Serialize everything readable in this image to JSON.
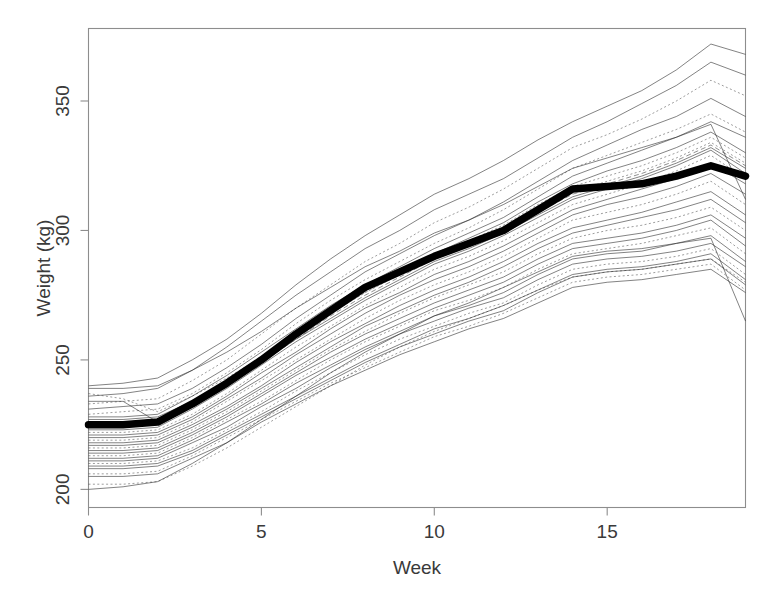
{
  "chart_data": {
    "type": "line",
    "title": "",
    "subtitle": "",
    "xlabel": "Week",
    "ylabel": "Weight (kg)",
    "xlim": [
      0,
      19
    ],
    "ylim": [
      193,
      378
    ],
    "xticks": [
      0,
      5,
      10,
      15
    ],
    "xtick_labels": [
      "0",
      "5",
      "10",
      "15"
    ],
    "yticks": [
      200,
      250,
      300,
      350
    ],
    "ytick_labels": [
      "200",
      "250",
      "300",
      "350"
    ],
    "grid": false,
    "legend": "none",
    "x": [
      0,
      1,
      2,
      3,
      4,
      5,
      6,
      7,
      8,
      9,
      10,
      11,
      12,
      13,
      14,
      15,
      16,
      17,
      18,
      19
    ],
    "mean_series": {
      "name": "Mean weight",
      "style": "solid-heavy",
      "color": "#000000",
      "values": [
        225,
        225,
        226,
        233,
        241,
        250,
        260,
        269,
        278,
        284,
        290,
        295,
        300,
        308,
        316,
        317,
        318,
        321,
        325,
        321
      ]
    },
    "series": [
      {
        "name": "subject-01",
        "style": "solid",
        "values": [
          240,
          241,
          243,
          250,
          258,
          268,
          279,
          289,
          298,
          306,
          314,
          320,
          327,
          335,
          342,
          348,
          354,
          362,
          372,
          368
        ]
      },
      {
        "name": "subject-02",
        "style": "solid",
        "values": [
          236,
          237,
          239,
          246,
          255,
          265,
          275,
          284,
          293,
          300,
          308,
          314,
          320,
          328,
          336,
          342,
          349,
          356,
          365,
          360
        ]
      },
      {
        "name": "subject-03",
        "style": "dotted",
        "values": [
          233,
          234,
          235,
          242,
          250,
          260,
          270,
          279,
          288,
          295,
          303,
          309,
          316,
          324,
          332,
          337,
          343,
          350,
          358,
          352
        ]
      },
      {
        "name": "subject-04",
        "style": "solid",
        "values": [
          231,
          232,
          233,
          239,
          247,
          256,
          266,
          275,
          284,
          291,
          298,
          304,
          311,
          319,
          327,
          333,
          339,
          344,
          351,
          344
        ]
      },
      {
        "name": "subject-05",
        "style": "dotted",
        "values": [
          229,
          230,
          231,
          237,
          245,
          254,
          264,
          273,
          281,
          288,
          295,
          301,
          308,
          316,
          324,
          329,
          334,
          339,
          345,
          338
        ]
      },
      {
        "name": "subject-06",
        "style": "solid",
        "values": [
          228,
          228,
          229,
          236,
          244,
          253,
          262,
          271,
          279,
          286,
          293,
          299,
          305,
          313,
          321,
          326,
          331,
          336,
          342,
          336
        ]
      },
      {
        "name": "subject-07",
        "style": "solid",
        "values": [
          227,
          227,
          228,
          234,
          242,
          251,
          260,
          269,
          277,
          284,
          291,
          297,
          303,
          311,
          318,
          323,
          327,
          332,
          338,
          330
        ]
      },
      {
        "name": "subject-08",
        "style": "dotted",
        "values": [
          226,
          226,
          227,
          233,
          241,
          250,
          259,
          268,
          276,
          283,
          290,
          296,
          302,
          310,
          317,
          321,
          325,
          330,
          336,
          328
        ]
      },
      {
        "name": "subject-09",
        "style": "solid",
        "values": [
          239,
          239,
          240,
          246,
          253,
          261,
          270,
          278,
          286,
          292,
          299,
          304,
          310,
          317,
          324,
          328,
          332,
          336,
          341,
          312
        ]
      },
      {
        "name": "subject-10",
        "style": "dashed",
        "values": [
          224,
          225,
          226,
          232,
          240,
          249,
          258,
          267,
          275,
          282,
          289,
          294,
          300,
          307,
          314,
          318,
          322,
          327,
          333,
          325
        ]
      },
      {
        "name": "subject-11",
        "style": "solid",
        "values": [
          223,
          223,
          224,
          231,
          239,
          248,
          257,
          265,
          273,
          280,
          287,
          292,
          298,
          305,
          312,
          316,
          320,
          325,
          331,
          322
        ]
      },
      {
        "name": "subject-12",
        "style": "dotted",
        "values": [
          222,
          222,
          223,
          229,
          237,
          246,
          255,
          263,
          271,
          278,
          285,
          290,
          296,
          303,
          310,
          314,
          318,
          323,
          329,
          320
        ]
      },
      {
        "name": "subject-13",
        "style": "solid",
        "values": [
          221,
          221,
          222,
          228,
          236,
          245,
          253,
          262,
          270,
          276,
          283,
          288,
          294,
          301,
          308,
          312,
          316,
          320,
          326,
          318
        ]
      },
      {
        "name": "subject-14",
        "style": "solid",
        "values": [
          220,
          220,
          221,
          227,
          235,
          243,
          252,
          260,
          268,
          275,
          281,
          286,
          292,
          299,
          306,
          310,
          313,
          317,
          322,
          314
        ]
      },
      {
        "name": "subject-15",
        "style": "dotted",
        "values": [
          219,
          219,
          220,
          226,
          234,
          242,
          250,
          258,
          266,
          273,
          279,
          284,
          290,
          297,
          304,
          307,
          310,
          314,
          319,
          310
        ]
      },
      {
        "name": "subject-16",
        "style": "solid",
        "values": [
          218,
          218,
          219,
          225,
          232,
          240,
          249,
          257,
          264,
          271,
          277,
          282,
          288,
          295,
          301,
          304,
          307,
          311,
          315,
          306
        ]
      },
      {
        "name": "subject-17",
        "style": "solid",
        "values": [
          217,
          217,
          218,
          224,
          231,
          239,
          247,
          255,
          263,
          269,
          275,
          280,
          286,
          293,
          299,
          302,
          305,
          308,
          312,
          303
        ]
      },
      {
        "name": "subject-18",
        "style": "dotted",
        "values": [
          216,
          216,
          217,
          223,
          230,
          238,
          246,
          254,
          261,
          268,
          274,
          279,
          284,
          291,
          297,
          300,
          302,
          305,
          309,
          300
        ]
      },
      {
        "name": "subject-19",
        "style": "solid",
        "values": [
          215,
          215,
          216,
          222,
          229,
          237,
          245,
          253,
          260,
          266,
          272,
          277,
          282,
          289,
          295,
          297,
          299,
          302,
          306,
          297
        ]
      },
      {
        "name": "subject-20",
        "style": "solid",
        "values": [
          214,
          214,
          215,
          221,
          228,
          236,
          244,
          251,
          258,
          264,
          270,
          275,
          280,
          287,
          293,
          295,
          297,
          300,
          304,
          294
        ]
      },
      {
        "name": "subject-21",
        "style": "dotted",
        "values": [
          213,
          213,
          214,
          220,
          227,
          234,
          242,
          250,
          257,
          263,
          269,
          273,
          278,
          285,
          291,
          293,
          295,
          298,
          301,
          291
        ]
      },
      {
        "name": "subject-22",
        "style": "solid",
        "values": [
          212,
          212,
          213,
          219,
          226,
          233,
          241,
          248,
          255,
          261,
          267,
          271,
          276,
          283,
          289,
          291,
          292,
          295,
          298,
          288
        ]
      },
      {
        "name": "subject-23",
        "style": "solid",
        "values": [
          211,
          211,
          212,
          218,
          224,
          232,
          239,
          247,
          254,
          260,
          265,
          270,
          274,
          281,
          287,
          289,
          290,
          292,
          295,
          286
        ]
      },
      {
        "name": "subject-24",
        "style": "dotted",
        "values": [
          210,
          210,
          211,
          216,
          223,
          230,
          238,
          245,
          252,
          258,
          263,
          268,
          272,
          279,
          285,
          287,
          288,
          290,
          293,
          283
        ]
      },
      {
        "name": "subject-25",
        "style": "solid",
        "values": [
          209,
          209,
          210,
          215,
          222,
          229,
          236,
          243,
          250,
          256,
          262,
          266,
          271,
          277,
          283,
          285,
          286,
          288,
          291,
          281
        ]
      },
      {
        "name": "subject-26",
        "style": "solid",
        "values": [
          208,
          208,
          209,
          214,
          221,
          228,
          235,
          242,
          249,
          255,
          260,
          265,
          269,
          276,
          282,
          284,
          285,
          287,
          289,
          279
        ]
      },
      {
        "name": "subject-27",
        "style": "dotted",
        "values": [
          206,
          206,
          207,
          213,
          220,
          227,
          234,
          241,
          247,
          253,
          259,
          263,
          268,
          274,
          280,
          282,
          283,
          285,
          287,
          277
        ]
      },
      {
        "name": "subject-28",
        "style": "solid",
        "values": [
          205,
          205,
          206,
          212,
          218,
          226,
          233,
          240,
          246,
          252,
          257,
          262,
          266,
          272,
          278,
          280,
          281,
          283,
          285,
          276
        ]
      },
      {
        "name": "subject-29",
        "style": "dotted",
        "values": [
          202,
          202,
          203,
          209,
          216,
          224,
          232,
          240,
          248,
          255,
          261,
          266,
          271,
          277,
          282,
          284,
          285,
          287,
          289,
          280
        ]
      },
      {
        "name": "subject-30",
        "style": "solid",
        "values": [
          200,
          201,
          203,
          210,
          218,
          227,
          236,
          245,
          253,
          260,
          267,
          272,
          278,
          284,
          290,
          292,
          293,
          295,
          297,
          265
        ]
      },
      {
        "name": "subject-31",
        "style": "solid",
        "values": [
          234,
          234,
          226,
          232,
          240,
          249,
          258,
          266,
          274,
          281,
          288,
          293,
          299,
          306,
          313,
          317,
          321,
          326,
          332,
          324
        ]
      },
      {
        "name": "subject-32",
        "style": "dotted",
        "values": [
          237,
          235,
          230,
          236,
          243,
          251,
          260,
          268,
          276,
          283,
          290,
          295,
          301,
          308,
          315,
          319,
          323,
          328,
          334,
          326
        ]
      }
    ]
  },
  "axis": {
    "y_title": "Weight (kg)",
    "x_title": "Week"
  }
}
